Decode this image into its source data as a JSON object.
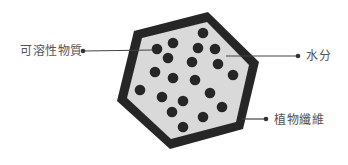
{
  "diagram": {
    "type": "cell-structure",
    "colors": {
      "wall": "#262626",
      "interior": "#d9d9d9",
      "particle": "#262626",
      "leader_line": "#444444",
      "label_text": "#555555"
    },
    "labels": {
      "soluble_matter": "可溶性物質",
      "water": "水分",
      "plant_fiber": "植物纖維"
    },
    "particle_count": 20
  }
}
